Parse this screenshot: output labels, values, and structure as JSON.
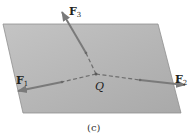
{
  "diagram": {
    "caption": "(c)",
    "point": {
      "label": "Q",
      "x": 96,
      "y": 74
    },
    "plane": {
      "points": "3,24 158,24 181,113 23,113",
      "fill": "#b8b8b8",
      "stroke": "#8a8a8a"
    },
    "arrow_color": "#7a7a7a",
    "forces": [
      {
        "name": "F",
        "sub": "1",
        "tip": [
          18,
          91
        ],
        "solid_from": [
          62,
          82
        ],
        "label_pos": [
          16,
          82
        ]
      },
      {
        "name": "F",
        "sub": "2",
        "tip": [
          185,
          85
        ],
        "solid_from": [
          140,
          80
        ],
        "label_pos": [
          176,
          82
        ]
      },
      {
        "name": "F",
        "sub": "3",
        "tip": [
          62,
          12
        ],
        "solid_from": [
          86,
          53
        ],
        "label_pos": [
          69,
          14
        ]
      }
    ]
  }
}
